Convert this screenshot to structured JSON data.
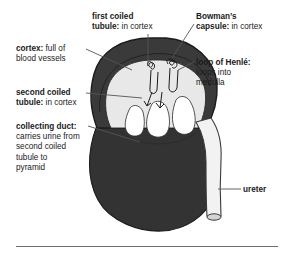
{
  "figure": {
    "background_color": "#ffffff",
    "rule_color": "#6e6e6e"
  },
  "colors": {
    "capsule_outline": "#1c1c1c",
    "cortex_band": "#3a3a3a",
    "medulla": "#e8e8e8",
    "pyramid": "#c9c9c9",
    "renal_body": "#333333",
    "ureter": "#f2f2f2",
    "leader_line": "#555555",
    "text": "#1a1a1a"
  },
  "labels": [
    {
      "name": "first-coiled-tubule",
      "lines": [
        {
          "term": "first coiled",
          "desc": ""
        },
        {
          "term": "tubule:",
          "desc": " in cortex"
        }
      ]
    },
    {
      "name": "bowmans-capsule",
      "lines": [
        {
          "term": "Bowman’s",
          "desc": ""
        },
        {
          "term": "capsule:",
          "desc": " in cortex"
        }
      ]
    },
    {
      "name": "cortex",
      "lines": [
        {
          "term": "cortex:",
          "desc": " full of"
        },
        {
          "term": "",
          "desc": "blood vessels"
        }
      ]
    },
    {
      "name": "loop-of-henle",
      "lines": [
        {
          "term": "loop of Henlé:",
          "desc": ""
        },
        {
          "term": "",
          "desc": "loops into"
        },
        {
          "term": "",
          "desc": "medulla"
        }
      ]
    },
    {
      "name": "second-coiled-tubule",
      "lines": [
        {
          "term": "second coiled",
          "desc": ""
        },
        {
          "term": "tubule:",
          "desc": " in cortex"
        }
      ]
    },
    {
      "name": "collecting-duct",
      "lines": [
        {
          "term": "collecting duct:",
          "desc": ""
        },
        {
          "term": "",
          "desc": "carries urine from"
        },
        {
          "term": "",
          "desc": "second coiled"
        },
        {
          "term": "",
          "desc": "tubule to"
        },
        {
          "term": "",
          "desc": "pyramid"
        }
      ]
    },
    {
      "name": "ureter",
      "lines": [
        {
          "term": "ureter",
          "desc": ""
        }
      ]
    }
  ]
}
